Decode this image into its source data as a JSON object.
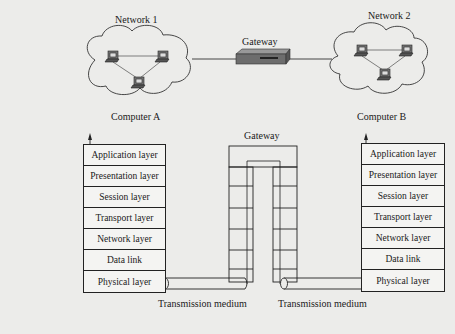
{
  "network1": {
    "title": "Network 1",
    "computer_label": "Computer A"
  },
  "network2": {
    "title": "Network 2",
    "computer_label": "Computer B"
  },
  "gateway_top": {
    "label": "Gateway"
  },
  "gateway_mid": {
    "label": "Gateway"
  },
  "stack_a": {
    "layers": [
      "Application layer",
      "Presentation layer",
      "Session layer",
      "Transport layer",
      "Network layer",
      "Data link",
      "Physical layer"
    ]
  },
  "stack_b": {
    "layers": [
      "Application layer",
      "Presentation layer",
      "Session layer",
      "Transport layer",
      "Network layer",
      "Data link",
      "Physical layer"
    ]
  },
  "medium_left": {
    "label": "Transmission medium"
  },
  "medium_right": {
    "label": "Transmission medium"
  }
}
